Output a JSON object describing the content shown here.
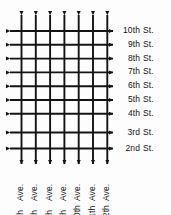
{
  "diagram": {
    "type": "city-grid",
    "background_color": "#fdfdfd",
    "line_color": "#141414",
    "text_color": "#141414",
    "line_width": 1.9,
    "arrow_style": "two-way-solid-triangle",
    "streets": {
      "orientation": "horizontal",
      "direction": "two-way",
      "count": 9,
      "items": [
        {
          "num": "10th",
          "sfx": "St.",
          "y": 31
        },
        {
          "num": "9th",
          "sfx": "St.",
          "y": 44.8
        },
        {
          "num": "8th",
          "sfx": "St.",
          "y": 58.6
        },
        {
          "num": "7th",
          "sfx": "St.",
          "y": 72.4
        },
        {
          "num": "6th",
          "sfx": "St.",
          "y": 86.2
        },
        {
          "num": "5th",
          "sfx": "St.",
          "y": 100
        },
        {
          "num": "4th",
          "sfx": "St.",
          "y": 113.8
        },
        {
          "num": "3rd",
          "sfx": "St.",
          "y": 132.5
        },
        {
          "num": "2nd",
          "sfx": "St.",
          "y": 148.5
        }
      ],
      "line_x_start": 10,
      "line_x_end": 113,
      "label_x": 120
    },
    "avenues": {
      "orientation": "vertical",
      "direction": "two-way",
      "count": 7,
      "items": [
        {
          "num": "6th",
          "sfx": "Ave.",
          "x": 21.5
        },
        {
          "num": "7th",
          "sfx": "Ave.",
          "x": 35.8
        },
        {
          "num": "8th",
          "sfx": "Ave.",
          "x": 50.1
        },
        {
          "num": "9th",
          "sfx": "Ave.",
          "x": 64.4
        },
        {
          "num": "10th",
          "sfx": "Ave.",
          "x": 78.7
        },
        {
          "num": "11th",
          "sfx": "Ave.",
          "x": 93.0
        },
        {
          "num": "12th",
          "sfx": "Ave.",
          "x": 107.3
        }
      ],
      "line_y_start": 15,
      "line_y_end": 164,
      "label_y": 213
    }
  }
}
